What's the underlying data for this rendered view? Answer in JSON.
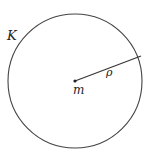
{
  "diagram": {
    "circle_label": "K",
    "center_label": "m",
    "radius_label": "ρ",
    "colors": {
      "stroke": "#444444",
      "text": "#222222",
      "background": "#ffffff"
    },
    "geometry": {
      "center": [
        75,
        81
      ],
      "radius": 67,
      "radius_endpoint": [
        134,
        57
      ]
    }
  }
}
